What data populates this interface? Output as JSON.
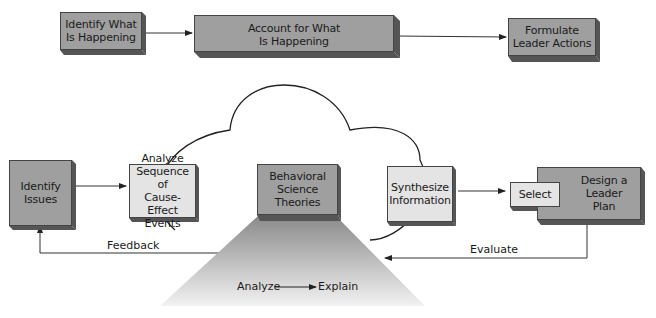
{
  "top_row": {
    "identify": "Identify What\nIs Happening",
    "account": "Account for What\nIs Happening",
    "formulate": "Formulate\nLeader Actions"
  },
  "bottom_row": {
    "identify_issues": "Identify\nIssues",
    "analyze_sequence": "Analyze\nSequence of\nCause-Effect\nEvents",
    "behavioral": "Behavioral\nScience\nTheories",
    "synthesize": "Synthesize\nInformation",
    "select": "Select",
    "design": "Design a\nLeader\nPlan"
  },
  "labels": {
    "feedback": "Feedback",
    "evaluate": "Evaluate",
    "analyze": "Analyze",
    "explain": "Explain"
  },
  "colors": {
    "dark_box": "#9f9f9f",
    "light_box": "#e4e4e4",
    "shadow": "#555555",
    "line": "#333333"
  }
}
